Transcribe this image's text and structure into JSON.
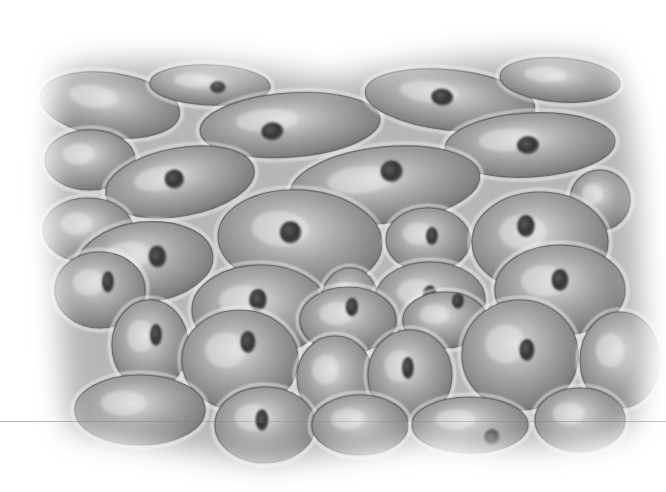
{
  "image": {
    "subject": "epithelial-cell-sheet-illustration",
    "style": "grayscale",
    "colors": {
      "background": "#ffffff",
      "intercellular": "#b9b9b9",
      "cell_light": "#d2d2d2",
      "cell_mid": "#9a9a9a",
      "cell_dark": "#6e6e6e",
      "nucleus": "#3a3a3a",
      "membrane_highlight": "#f2f2f2"
    },
    "cells": [
      {
        "cx": 110,
        "cy": 105,
        "rx": 70,
        "ry": 32,
        "rot": 8,
        "nx": null,
        "ny": null
      },
      {
        "cx": 210,
        "cy": 85,
        "rx": 60,
        "ry": 20,
        "rot": 2,
        "nx": 218,
        "ny": 87
      },
      {
        "cx": 290,
        "cy": 125,
        "rx": 90,
        "ry": 32,
        "rot": -4,
        "nx": 272,
        "ny": 130
      },
      {
        "cx": 450,
        "cy": 100,
        "rx": 85,
        "ry": 30,
        "rot": 6,
        "nx": 442,
        "ny": 98
      },
      {
        "cx": 560,
        "cy": 80,
        "rx": 60,
        "ry": 22,
        "rot": 4,
        "nx": null,
        "ny": null
      },
      {
        "cx": 530,
        "cy": 145,
        "rx": 85,
        "ry": 32,
        "rot": -3,
        "nx": 528,
        "ny": 145
      },
      {
        "cx": 90,
        "cy": 160,
        "rx": 45,
        "ry": 30,
        "rot": 0,
        "nx": null,
        "ny": null
      },
      {
        "cx": 180,
        "cy": 182,
        "rx": 75,
        "ry": 34,
        "rot": -10,
        "nx": 175,
        "ny": 178
      },
      {
        "cx": 385,
        "cy": 185,
        "rx": 95,
        "ry": 38,
        "rot": -6,
        "nx": 393,
        "ny": 172
      },
      {
        "cx": 600,
        "cy": 200,
        "rx": 30,
        "ry": 30,
        "rot": 0,
        "nx": null,
        "ny": null
      },
      {
        "cx": 88,
        "cy": 230,
        "rx": 45,
        "ry": 32,
        "rot": 0,
        "nx": null,
        "ny": null
      },
      {
        "cx": 145,
        "cy": 262,
        "rx": 68,
        "ry": 40,
        "rot": -6,
        "nx": 158,
        "ny": 258
      },
      {
        "cx": 300,
        "cy": 240,
        "rx": 82,
        "ry": 50,
        "rot": 4,
        "nx": 290,
        "ny": 233
      },
      {
        "cx": 428,
        "cy": 240,
        "rx": 42,
        "ry": 32,
        "rot": 0,
        "nx": 432,
        "ny": 236
      },
      {
        "cx": 540,
        "cy": 242,
        "rx": 68,
        "ry": 50,
        "rot": 0,
        "nx": 526,
        "ny": 226
      },
      {
        "cx": 260,
        "cy": 310,
        "rx": 68,
        "ry": 45,
        "rot": 0,
        "nx": 258,
        "ny": 300
      },
      {
        "cx": 350,
        "cy": 300,
        "rx": 28,
        "ry": 32,
        "rot": 0,
        "nx": null,
        "ny": null
      },
      {
        "cx": 430,
        "cy": 300,
        "rx": 55,
        "ry": 38,
        "rot": 0,
        "nx": 430,
        "ny": 296
      },
      {
        "cx": 560,
        "cy": 290,
        "rx": 65,
        "ry": 45,
        "rot": 0,
        "nx": 560,
        "ny": 280
      },
      {
        "cx": 100,
        "cy": 290,
        "rx": 45,
        "ry": 38,
        "rot": 0,
        "nx": 108,
        "ny": 282
      },
      {
        "cx": 150,
        "cy": 345,
        "rx": 38,
        "ry": 45,
        "rot": 0,
        "nx": 156,
        "ny": 335
      },
      {
        "cx": 240,
        "cy": 360,
        "rx": 58,
        "ry": 50,
        "rot": 0,
        "nx": 248,
        "ny": 342
      },
      {
        "cx": 348,
        "cy": 320,
        "rx": 48,
        "ry": 33,
        "rot": 0,
        "nx": 352,
        "ny": 307
      },
      {
        "cx": 445,
        "cy": 320,
        "rx": 42,
        "ry": 28,
        "rot": 0,
        "nx": 458,
        "ny": 301
      },
      {
        "cx": 335,
        "cy": 378,
        "rx": 38,
        "ry": 42,
        "rot": 0,
        "nx": null,
        "ny": null
      },
      {
        "cx": 410,
        "cy": 375,
        "rx": 42,
        "ry": 45,
        "rot": 0,
        "nx": 408,
        "ny": 368
      },
      {
        "cx": 520,
        "cy": 355,
        "rx": 58,
        "ry": 55,
        "rot": 0,
        "nx": 527,
        "ny": 350
      },
      {
        "cx": 620,
        "cy": 360,
        "rx": 40,
        "ry": 48,
        "rot": 0,
        "nx": null,
        "ny": null
      },
      {
        "cx": 140,
        "cy": 410,
        "rx": 65,
        "ry": 35,
        "rot": 0,
        "nx": null,
        "ny": null
      },
      {
        "cx": 265,
        "cy": 425,
        "rx": 50,
        "ry": 38,
        "rot": 0,
        "nx": 262,
        "ny": 420
      },
      {
        "cx": 360,
        "cy": 425,
        "rx": 48,
        "ry": 30,
        "rot": 0,
        "nx": null,
        "ny": null
      },
      {
        "cx": 470,
        "cy": 425,
        "rx": 58,
        "ry": 28,
        "rot": 0,
        "nx": 492,
        "ny": 437
      },
      {
        "cx": 580,
        "cy": 420,
        "rx": 45,
        "ry": 32,
        "rot": 0,
        "nx": null,
        "ny": null
      }
    ]
  }
}
